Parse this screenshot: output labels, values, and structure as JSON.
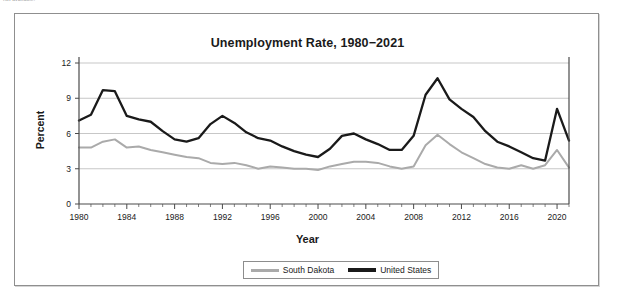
{
  "document": {
    "clipped_header_note": "not available."
  },
  "legend": {
    "position": "bottom-center",
    "entries": [
      {
        "label": "South Dakota",
        "color": "#aaaaaa"
      },
      {
        "label": "United States",
        "color": "#1a1a1a"
      }
    ]
  },
  "chart_data": {
    "type": "line",
    "title": "Unemployment Rate, 1980−2021",
    "xlabel": "Year",
    "ylabel": "Percent",
    "xlim": [
      1980,
      2021
    ],
    "ylim": [
      0,
      12
    ],
    "yticks": [
      0,
      3,
      6,
      9,
      12
    ],
    "xticks": [
      1980,
      1984,
      1988,
      1992,
      1996,
      2000,
      2004,
      2008,
      2012,
      2016,
      2020
    ],
    "x_minor_tick_interval": 1,
    "grid": "horizontal",
    "x": [
      1980,
      1981,
      1982,
      1983,
      1984,
      1985,
      1986,
      1987,
      1988,
      1989,
      1990,
      1991,
      1992,
      1993,
      1994,
      1995,
      1996,
      1997,
      1998,
      1999,
      2000,
      2001,
      2002,
      2003,
      2004,
      2005,
      2006,
      2007,
      2008,
      2009,
      2010,
      2011,
      2012,
      2013,
      2014,
      2015,
      2016,
      2017,
      2018,
      2019,
      2020,
      2021
    ],
    "series": [
      {
        "name": "South Dakota",
        "color": "#aaaaaa",
        "values": [
          4.8,
          4.8,
          5.3,
          5.5,
          4.8,
          4.9,
          4.6,
          4.4,
          4.2,
          4.0,
          3.9,
          3.5,
          3.4,
          3.5,
          3.3,
          3.0,
          3.2,
          3.1,
          3.0,
          3.0,
          2.9,
          3.2,
          3.4,
          3.6,
          3.6,
          3.5,
          3.2,
          3.0,
          3.2,
          5.0,
          5.9,
          5.1,
          4.4,
          3.9,
          3.4,
          3.1,
          3.0,
          3.3,
          3.0,
          3.3,
          4.6,
          3.1
        ]
      },
      {
        "name": "United States",
        "color": "#1a1a1a",
        "values": [
          7.1,
          7.6,
          9.7,
          9.6,
          7.5,
          7.2,
          7.0,
          6.2,
          5.5,
          5.3,
          5.6,
          6.8,
          7.5,
          6.9,
          6.1,
          5.6,
          5.4,
          4.9,
          4.5,
          4.2,
          4.0,
          4.7,
          5.8,
          6.0,
          5.5,
          5.1,
          4.6,
          4.6,
          5.8,
          9.3,
          10.7,
          8.9,
          8.1,
          7.4,
          6.2,
          5.3,
          4.9,
          4.4,
          3.9,
          3.7,
          8.1,
          5.4
        ]
      }
    ]
  }
}
